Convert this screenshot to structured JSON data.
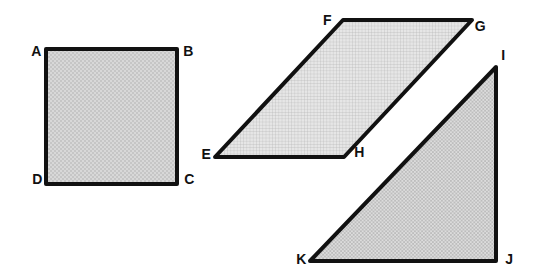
{
  "figure": {
    "description_names": [
      "square",
      "parallelogram",
      "right-triangle"
    ],
    "vertex_labels": {
      "a": "A",
      "b": "B",
      "c": "C",
      "d": "D",
      "e": "E",
      "f": "F",
      "g": "G",
      "h": "H",
      "i": "I",
      "j": "J",
      "k": "K"
    }
  },
  "colors": {
    "background": "#ffffff",
    "outline": "#111111",
    "label_text": "#111111",
    "square_fill_base": "#d8d8d8",
    "square_fill_dot": "#a8a8a8",
    "parallelogram_fill_base": "#e6e6e6",
    "parallelogram_grid_line": "#b0b0b0",
    "triangle_fill_light": "#dcdcdc",
    "triangle_fill_dark": "#bdbdbd"
  }
}
